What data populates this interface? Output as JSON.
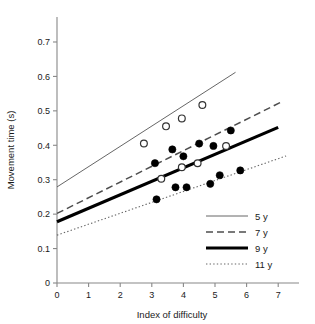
{
  "chart_data": {
    "type": "scatter",
    "title": "",
    "xlabel": "Index of difficulty",
    "ylabel": "Movement time (s)",
    "xlim": [
      0,
      7.6
    ],
    "ylim": [
      0,
      0.78
    ],
    "xticks": [
      "0",
      "1",
      "2",
      "3",
      "4",
      "5",
      "6",
      "7"
    ],
    "xtick_values": [
      0,
      1,
      2,
      3,
      4,
      5,
      6,
      7
    ],
    "yticks": [
      "0",
      "0.1",
      "0.2",
      "0.3",
      "0.4",
      "0.5",
      "0.6",
      "0.7"
    ],
    "ytick_values": [
      0,
      0.1,
      0.2,
      0.3,
      0.4,
      0.5,
      0.6,
      0.7
    ],
    "grid": false,
    "legend_position": "bottom-right",
    "series": [
      {
        "name": "5 y",
        "style": "thin-solid",
        "color": "#555555",
        "marker": "open-circle",
        "fit_x": [
          0.0,
          5.65
        ],
        "fit_y": [
          0.279,
          0.612
        ],
        "points_x": [
          2.75,
          3.45,
          3.95,
          4.6
        ],
        "points_y": [
          0.405,
          0.455,
          0.478,
          0.517
        ]
      },
      {
        "name": "7 y",
        "style": "dashed",
        "color": "#4d4d4d",
        "marker": "filled-circle",
        "fit_x": [
          0.0,
          7.15
        ],
        "fit_y": [
          0.202,
          0.528
        ],
        "points_x": [
          3.1,
          3.65,
          4.0,
          4.5,
          4.95,
          5.5
        ],
        "points_y": [
          0.348,
          0.388,
          0.368,
          0.405,
          0.398,
          0.443
        ]
      },
      {
        "name": "9 y",
        "style": "thick-solid",
        "color": "#000000",
        "marker": "open-circle",
        "fit_x": [
          0.0,
          7.0
        ],
        "fit_y": [
          0.178,
          0.452
        ],
        "points_x": [
          3.3,
          3.95,
          4.45,
          5.35
        ],
        "points_y": [
          0.303,
          0.336,
          0.348,
          0.398
        ]
      },
      {
        "name": "11 y",
        "style": "dotted",
        "color": "#666666",
        "marker": "filled-circle",
        "fit_x": [
          0.0,
          7.25
        ],
        "fit_y": [
          0.139,
          0.369
        ],
        "points_x": [
          3.15,
          3.75,
          4.1,
          4.85,
          5.15,
          5.8
        ],
        "points_y": [
          0.243,
          0.278,
          0.278,
          0.288,
          0.313,
          0.327
        ]
      }
    ],
    "legend": [
      {
        "label": "5 y",
        "style": "thin-solid"
      },
      {
        "label": "7 y",
        "style": "dashed"
      },
      {
        "label": "9 y",
        "style": "thick-solid"
      },
      {
        "label": "11 y",
        "style": "dotted"
      }
    ]
  }
}
